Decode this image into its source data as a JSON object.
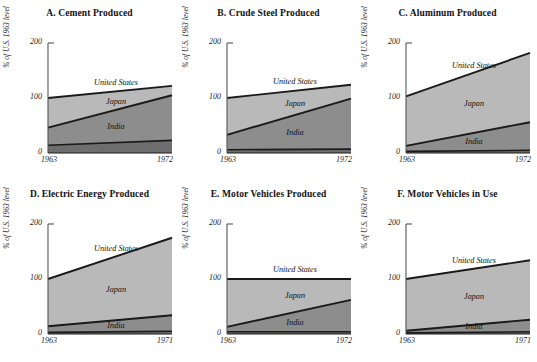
{
  "figure": {
    "axis": {
      "y_label": "% of U.S. 1963 level",
      "y_ticks": [
        "0",
        "100",
        "200"
      ],
      "y_tick_values": [
        0,
        100,
        200
      ],
      "ylim": [
        0,
        200
      ]
    },
    "series_names": [
      "United States",
      "Japan",
      "India"
    ],
    "colors": {
      "united_states_band": "#b9b9b9",
      "japan_band": "#8d8d8d",
      "india_band": "#6e6e6e",
      "line": "#1a1a1a",
      "axis": "#555555",
      "background": "#ffffff",
      "text": "#111111"
    }
  },
  "chart_data": [
    {
      "type": "area",
      "title": "A. Cement Produced",
      "xlabel": "",
      "ylabel": "% of U.S. 1963 level",
      "x": [
        1963,
        1972
      ],
      "xticks": [
        "1963",
        "1972"
      ],
      "ylim": [
        0,
        200
      ],
      "yticks": [
        0,
        100,
        200
      ],
      "grid": false,
      "legend": "inline-labels",
      "stacked": false,
      "series": [
        {
          "name": "United States",
          "values": [
            100,
            122
          ]
        },
        {
          "name": "Japan",
          "values": [
            46,
            105
          ]
        },
        {
          "name": "India",
          "values": [
            14,
            23
          ]
        }
      ]
    },
    {
      "type": "area",
      "title": "B. Crude Steel Produced",
      "xlabel": "",
      "ylabel": "% of U.S. 1963 level",
      "x": [
        1963,
        1972
      ],
      "xticks": [
        "1963",
        "1972"
      ],
      "ylim": [
        0,
        200
      ],
      "yticks": [
        0,
        100,
        200
      ],
      "grid": false,
      "legend": "inline-labels",
      "stacked": false,
      "series": [
        {
          "name": "United States",
          "values": [
            100,
            124
          ]
        },
        {
          "name": "Japan",
          "values": [
            33,
            99
          ]
        },
        {
          "name": "India",
          "values": [
            6,
            7
          ]
        }
      ]
    },
    {
      "type": "area",
      "title": "C. Aluminum Produced",
      "xlabel": "",
      "ylabel": "% of U.S. 1963 level",
      "x": [
        1963,
        1972
      ],
      "xticks": [
        "1963",
        "1972"
      ],
      "ylim": [
        0,
        200
      ],
      "yticks": [
        0,
        100,
        200
      ],
      "grid": false,
      "legend": "inline-labels",
      "stacked": false,
      "series": [
        {
          "name": "United States",
          "values": [
            103,
            182
          ]
        },
        {
          "name": "Japan",
          "values": [
            13,
            56
          ]
        },
        {
          "name": "India",
          "values": [
            3,
            5
          ]
        }
      ]
    },
    {
      "type": "area",
      "title": "D. Electric Energy Produced",
      "xlabel": "",
      "ylabel": "% of U.S. 1963 level",
      "x": [
        1963,
        1971
      ],
      "xticks": [
        "1963",
        "1971"
      ],
      "ylim": [
        0,
        200
      ],
      "yticks": [
        0,
        100,
        200
      ],
      "grid": false,
      "legend": "inline-labels",
      "stacked": false,
      "series": [
        {
          "name": "United States",
          "values": [
            100,
            175
          ]
        },
        {
          "name": "Japan",
          "values": [
            14,
            34
          ]
        },
        {
          "name": "India",
          "values": [
            3,
            5
          ]
        }
      ]
    },
    {
      "type": "area",
      "title": "E. Motor Vehicles Produced",
      "xlabel": "",
      "ylabel": "% of U.S. 1963 level",
      "x": [
        1963,
        1972
      ],
      "xticks": [
        "1963",
        "1972"
      ],
      "ylim": [
        0,
        200
      ],
      "yticks": [
        0,
        100,
        200
      ],
      "grid": false,
      "legend": "inline-labels",
      "stacked": false,
      "series": [
        {
          "name": "United States",
          "values": [
            100,
            100
          ]
        },
        {
          "name": "Japan",
          "values": [
            13,
            62
          ]
        },
        {
          "name": "India",
          "values": [
            4,
            4
          ]
        }
      ]
    },
    {
      "type": "area",
      "title": "F. Motor Vehicles in Use",
      "xlabel": "",
      "ylabel": "% of U.S. 1963 level",
      "x": [
        1963,
        1971
      ],
      "xticks": [
        "1963",
        "1971"
      ],
      "ylim": [
        0,
        200
      ],
      "yticks": [
        0,
        100,
        200
      ],
      "grid": false,
      "legend": "inline-labels",
      "stacked": false,
      "series": [
        {
          "name": "United States",
          "values": [
            100,
            134
          ]
        },
        {
          "name": "Japan",
          "values": [
            6,
            26
          ]
        },
        {
          "name": "India",
          "values": [
            2,
            4
          ]
        }
      ]
    }
  ]
}
